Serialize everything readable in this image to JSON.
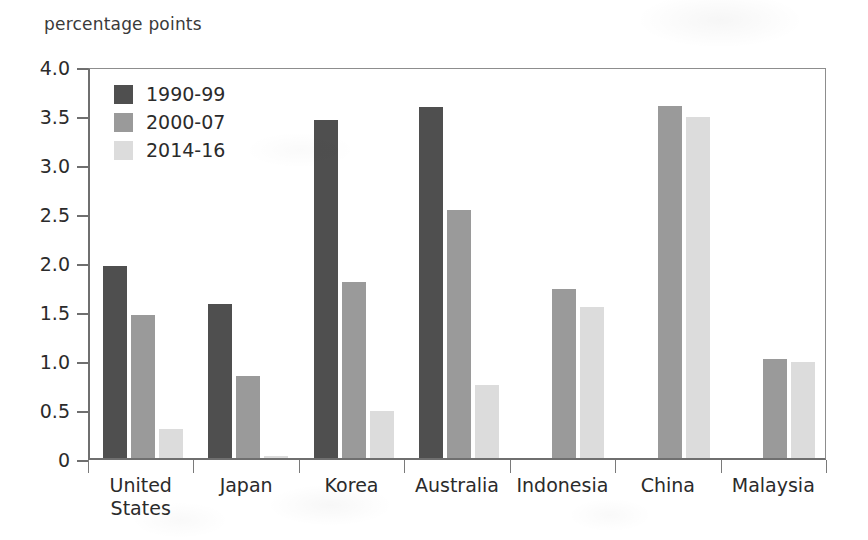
{
  "chart_data": {
    "type": "bar",
    "title": "percentage points",
    "xlabel": "",
    "ylabel": "percentage points",
    "ylim": [
      0,
      4.0
    ],
    "grid": false,
    "legend_position": "top-left-inside",
    "y_ticks": [
      "0",
      "0.5",
      "1.0",
      "1.5",
      "2.0",
      "2.5",
      "3.0",
      "3.5",
      "4.0"
    ],
    "y_tick_values": [
      0,
      0.5,
      1.0,
      1.5,
      2.0,
      2.5,
      3.0,
      3.5,
      4.0
    ],
    "categories": [
      "United\nStates",
      "Japan",
      "Korea",
      "Australia",
      "Indonesia",
      "China",
      "Malaysia"
    ],
    "series": [
      {
        "name": "1990-99",
        "color": "#4f4f4f",
        "values": [
          1.96,
          1.57,
          3.45,
          3.58,
          null,
          null,
          null
        ]
      },
      {
        "name": "2000-07",
        "color": "#9a9a9a",
        "values": [
          1.46,
          0.84,
          1.8,
          2.53,
          1.72,
          3.59,
          1.01
        ]
      },
      {
        "name": "2014-16",
        "color": "#dcdcdc",
        "values": [
          0.3,
          0.02,
          0.48,
          0.75,
          1.54,
          3.48,
          0.98
        ]
      }
    ]
  },
  "legend": {
    "entries": [
      {
        "label": "1990-99"
      },
      {
        "label": "2000-07"
      },
      {
        "label": "2014-16"
      }
    ]
  },
  "colors": {
    "series_1990_99": "#4f4f4f",
    "series_2000_07": "#9a9a9a",
    "series_2014_16": "#dcdcdc",
    "axis": "#6f6f6f",
    "text": "#2b2b2b",
    "background": "#ffffff"
  }
}
